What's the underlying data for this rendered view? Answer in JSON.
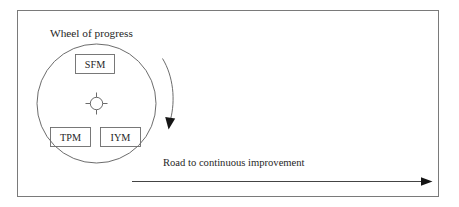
{
  "figure": {
    "title": "Wheel of progress",
    "road_label": "Road to continuous improvement",
    "wheel": {
      "name": "wheel-of-progress",
      "hub_label": "",
      "segments": [
        {
          "id": "sfm",
          "label": "SFM",
          "position": "top"
        },
        {
          "id": "tpm",
          "label": "TPM",
          "position": "bottom-left"
        },
        {
          "id": "iym",
          "label": "IYM",
          "position": "bottom-right"
        }
      ]
    },
    "rotation_arrow": {
      "name": "wheel-rotation-arrow",
      "direction": "clockwise",
      "description": "curved arrow pointing downward alongside the wheel"
    },
    "road_arrow": {
      "name": "road-arrow",
      "direction": "right",
      "description": "horizontal arrow pointing right"
    },
    "colors": {
      "line": "#5b5b5b",
      "box_line": "#6a6a6a",
      "frame": "#7a7a7a",
      "arrow": "#151515",
      "text": "#262626",
      "background": "#ffffff"
    }
  }
}
